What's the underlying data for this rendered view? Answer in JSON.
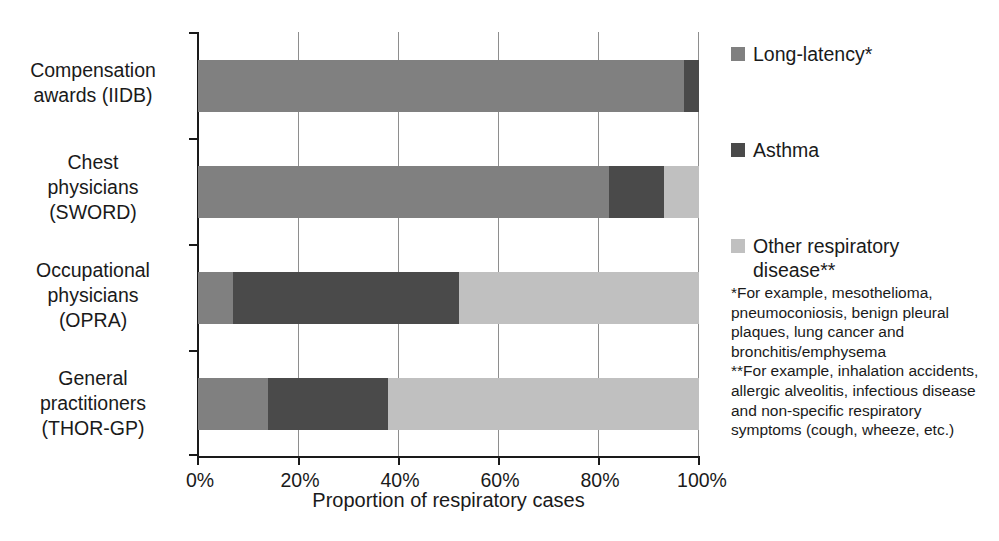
{
  "chart_data": {
    "type": "bar",
    "orientation": "horizontal",
    "stacked": true,
    "title": "",
    "xlabel": "Proportion of respiratory cases",
    "ylabel": "",
    "xlim": [
      0,
      100
    ],
    "xticks": [
      0,
      20,
      40,
      60,
      80,
      100
    ],
    "xtick_labels": [
      "0%",
      "20%",
      "40%",
      "60%",
      "80%",
      "100%"
    ],
    "grid": true,
    "grid_axis": "x",
    "legend_position": "right",
    "categories": [
      "Compensation\nawards (IIDB)",
      "Chest\nphysicians\n(SWORD)",
      "Occupational\nphysicians\n(OPRA)",
      "General\npractitioners\n(THOR-GP)"
    ],
    "series": [
      {
        "name": "Long-latency*",
        "color": "#808080",
        "values": [
          97,
          82,
          7,
          14
        ]
      },
      {
        "name": "Asthma",
        "color": "#4a4a4a",
        "values": [
          3,
          11,
          45,
          24
        ]
      },
      {
        "name": "Other respiratory\ndisease**",
        "color": "#c0c0c0",
        "values": [
          0,
          7,
          48,
          62
        ]
      }
    ]
  },
  "axis": {
    "x_title": "Proportion of respiratory cases",
    "tick_labels": [
      "0%",
      "20%",
      "40%",
      "60%",
      "80%",
      "100%"
    ]
  },
  "categories": {
    "iidb": "Compensation\nawards (IIDB)",
    "sword": "Chest\nphysicians\n(SWORD)",
    "opra": "Occupational\nphysicians\n(OPRA)",
    "thorgp": "General\npractitioners\n(THOR-GP)"
  },
  "legend": {
    "items": [
      {
        "label": "Long-latency*",
        "color": "#808080"
      },
      {
        "label": "Asthma",
        "color": "#4a4a4a"
      },
      {
        "label": "Other respiratory\ndisease**",
        "color": "#c0c0c0"
      }
    ]
  },
  "footnotes": {
    "text": "*For example, mesothelioma, pneumoconiosis, benign pleural plaques, lung cancer and bronchitis/emphysema\n**For example, inhalation accidents, allergic alveolitis, infectious disease and non-specific respiratory symptoms (cough, wheeze, etc.)"
  },
  "colors": {
    "long_latency": "#808080",
    "asthma": "#4a4a4a",
    "other": "#c0c0c0",
    "axis": "#1a1a1a",
    "grid": "#8e8e8e",
    "background": "#ffffff"
  }
}
